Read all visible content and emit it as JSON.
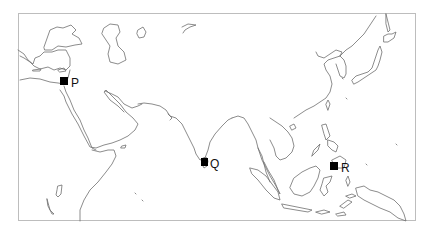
{
  "map": {
    "type": "outline-map",
    "region": "Middle East, South Asia, East Asia, Southeast Asia",
    "frame_color": "#bdbdbd",
    "coastline_color": "#6e6e6e",
    "marker_color": "#000000",
    "markers": [
      {
        "label": "P",
        "x": 64,
        "y": 82
      },
      {
        "label": "Q",
        "x": 204,
        "y": 163
      },
      {
        "label": "R",
        "x": 334,
        "y": 166
      }
    ]
  }
}
